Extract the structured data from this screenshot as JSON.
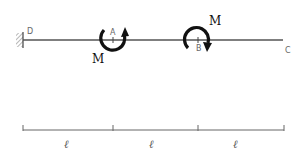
{
  "diagram": {
    "type": "beam-with-applied-moments",
    "colors": {
      "beam": "#555555",
      "moment_arrow": "#111111",
      "labels": "#666666",
      "dimension": "#666666"
    },
    "support": {
      "type": "fixed-wall",
      "at": "D"
    },
    "points": [
      {
        "label": "D",
        "description": "fixed end"
      },
      {
        "label": "A",
        "description": "point of applied moment"
      },
      {
        "label": "B",
        "description": "point of applied moment"
      },
      {
        "label": "C",
        "description": "free end"
      }
    ],
    "moments": [
      {
        "label": "M",
        "at": "A",
        "direction": "clockwise"
      },
      {
        "label": "M",
        "at": "B",
        "direction": "clockwise"
      }
    ],
    "dimensions": [
      {
        "from": "D",
        "to": "A",
        "label": "ℓ"
      },
      {
        "from": "A",
        "to": "B",
        "label": "ℓ"
      },
      {
        "from": "B",
        "to": "C",
        "label": "ℓ"
      }
    ]
  }
}
